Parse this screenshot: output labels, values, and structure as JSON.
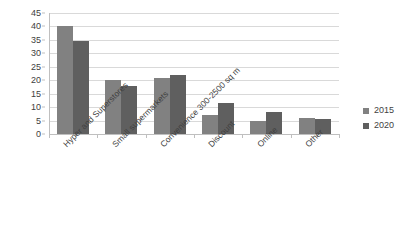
{
  "chart_data": {
    "type": "bar",
    "title": "",
    "subtitle": "",
    "xlabel": "",
    "ylabel": "",
    "ylim": [
      0,
      45
    ],
    "ytick_step": 5,
    "yticks": [
      "45",
      "40",
      "35",
      "30",
      "25",
      "20",
      "15",
      "10",
      "5",
      "0"
    ],
    "grid": true,
    "legend_position": "right",
    "categories": [
      "Hyper and Superstores",
      "Small supermarkets",
      "Convenience 300-2500 sq m",
      "Discount",
      "Online",
      "Other"
    ],
    "series": [
      {
        "name": "2015",
        "color": "#818181",
        "values": [
          40,
          20,
          21,
          7,
          5,
          6
        ]
      },
      {
        "name": "2020",
        "color": "#5f5f5f",
        "values": [
          34.5,
          17.8,
          21.8,
          11.5,
          8.3,
          5.5
        ]
      }
    ]
  },
  "legend": {
    "entries": [
      {
        "label": "2015"
      },
      {
        "label": "2020"
      }
    ]
  },
  "colors": {
    "series_2015": "#818181",
    "series_2020": "#5f5f5f",
    "gridline": "#d9d9d9",
    "axis": "#bfbfbf",
    "background": "#ffffff",
    "text": "#3f3f3f"
  }
}
